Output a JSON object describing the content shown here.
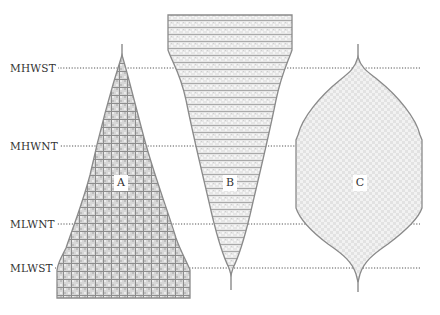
{
  "diagram": {
    "tide_levels": [
      {
        "label": "MHWST",
        "y": 68
      },
      {
        "label": "MHWNT",
        "y": 146
      },
      {
        "label": "MLWNT",
        "y": 224
      },
      {
        "label": "MLWST",
        "y": 268
      }
    ],
    "shapes": [
      {
        "id": "A",
        "label": "A",
        "pattern": "dense grid crosshatch"
      },
      {
        "id": "B",
        "label": "B",
        "pattern": "horizontal lines with light crosshatch"
      },
      {
        "id": "C",
        "label": "C",
        "pattern": "light diamond crosshatch"
      }
    ],
    "colors": {
      "outline": "#8a8a8a",
      "fill_light": "#e4e4e4",
      "grid_line": "#9a9a9a",
      "dotted_line": "#555555"
    }
  }
}
